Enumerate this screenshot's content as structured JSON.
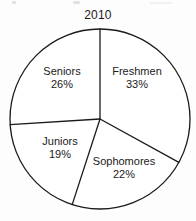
{
  "chart_data": {
    "type": "pie",
    "title": "2010",
    "categories": [
      "Freshmen",
      "Sophomores",
      "Juniors",
      "Seniors"
    ],
    "values": [
      33,
      22,
      19,
      26
    ],
    "value_suffix": "%",
    "labels": [
      "33%",
      "22%",
      "19%",
      "26%"
    ],
    "legend": "none",
    "grid": false,
    "xlabel": "",
    "ylabel": "",
    "slice_order": "clockwise from top",
    "geometry": {
      "center_x": 100,
      "center_y": 119,
      "radius": 90
    },
    "slices": [
      {
        "name": "Freshmen",
        "value": 33,
        "label": "33%",
        "start_deg": 0,
        "end_deg": 118.8,
        "label_x": 137,
        "label_y": 78
      },
      {
        "name": "Sophomores",
        "value": 22,
        "label": "22%",
        "start_deg": 118.8,
        "end_deg": 198.0,
        "label_x": 124,
        "label_y": 168
      },
      {
        "name": "Juniors",
        "value": 19,
        "label": "19%",
        "start_deg": 198.0,
        "end_deg": 266.4,
        "label_x": 60,
        "label_y": 148
      },
      {
        "name": "Seniors",
        "value": 26,
        "label": "26%",
        "start_deg": 266.4,
        "end_deg": 360.0,
        "label_x": 62,
        "label_y": 78
      }
    ]
  },
  "colors": {
    "background": "#fdfdfd",
    "stroke": "#1a1a1a",
    "slice_fill": "#ffffff",
    "text": "#1a1a1a"
  }
}
